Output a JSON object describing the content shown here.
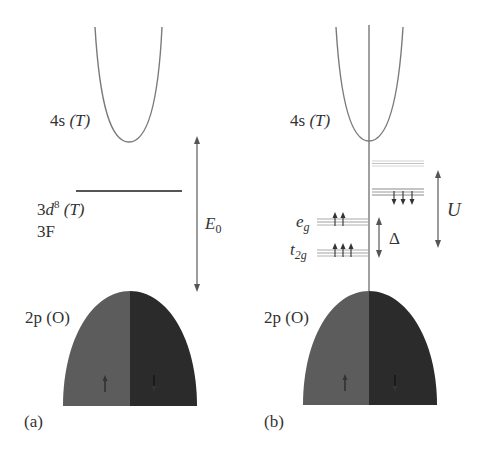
{
  "panels": [
    {
      "id": "a",
      "caption": "(a)",
      "band_4s": {
        "orbital": "4s",
        "site": "(T)"
      },
      "level_3d": {
        "orbital_base": "3",
        "orbital_letter": "d",
        "occupancy": "8",
        "site": "(T)",
        "term": "3F"
      },
      "gap_arrow": {
        "symbol": "E",
        "subscript": "0"
      },
      "band_2p": {
        "orbital": "2p",
        "site": "(O)",
        "spin_up": "↑",
        "spin_down": "↓"
      }
    },
    {
      "id": "b",
      "caption": "(b)",
      "band_4s": {
        "orbital": "4s",
        "site": "(T)"
      },
      "levels": {
        "eg": {
          "letter": "e",
          "subscript": "g",
          "spins": "↑↑"
        },
        "t2g": {
          "letter": "t",
          "subscript": "2g",
          "spins": "↑↑↑"
        },
        "minority_occupied_spins": "↓↓↓"
      },
      "crystal_field_arrow": {
        "symbol": "Δ"
      },
      "hubbard_arrow": {
        "symbol": "U"
      },
      "band_2p": {
        "orbital": "2p",
        "site": "(O)",
        "spin_up": "↑",
        "spin_down": "↓"
      }
    }
  ],
  "colors": {
    "line": "#6e6e6e",
    "band_up": "#5a5a5a",
    "band_down": "#2a2a2a",
    "level_light": "#c4c4c4",
    "level_mid": "#8a8a8a",
    "text": "#333333"
  }
}
